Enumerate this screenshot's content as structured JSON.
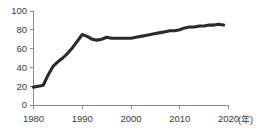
{
  "chart_data": {
    "type": "line",
    "title": "",
    "subtitle": "",
    "xlabel": "(年)",
    "ylabel": "",
    "xlim": [
      1980,
      2020
    ],
    "ylim": [
      0,
      100
    ],
    "grid": false,
    "legend": false,
    "legend_position": "none",
    "line_color": "#2b2b2b",
    "axis_color": "#8a8a8a",
    "x_ticks": [
      "1980",
      "1990",
      "2000",
      "2010",
      "2020"
    ],
    "x_tick_values": [
      1980,
      1990,
      2000,
      2010,
      2020
    ],
    "y_ticks": [
      "0",
      "20",
      "40",
      "60",
      "80",
      "100"
    ],
    "y_tick_values": [
      0,
      20,
      40,
      60,
      80,
      100
    ],
    "series": [
      {
        "name": "series-1",
        "x": [
          1980,
          1981,
          1982,
          1983,
          1984,
          1985,
          1986,
          1987,
          1988,
          1989,
          1990,
          1991,
          1992,
          1993,
          1994,
          1995,
          1996,
          1997,
          1998,
          1999,
          2000,
          2001,
          2002,
          2003,
          2004,
          2005,
          2006,
          2007,
          2008,
          2009,
          2010,
          2011,
          2012,
          2013,
          2014,
          2015,
          2016,
          2017,
          2018,
          2019
        ],
        "values": [
          19,
          20,
          21,
          32,
          41,
          46,
          50,
          55,
          61,
          68,
          75,
          73,
          70,
          69,
          70,
          72,
          71,
          71,
          71,
          71,
          71,
          72,
          73,
          74,
          75,
          76,
          77,
          78,
          79,
          79,
          80,
          82,
          83,
          83,
          84,
          84,
          85,
          85,
          86,
          85
        ]
      }
    ]
  },
  "axis_unit": "(年)"
}
